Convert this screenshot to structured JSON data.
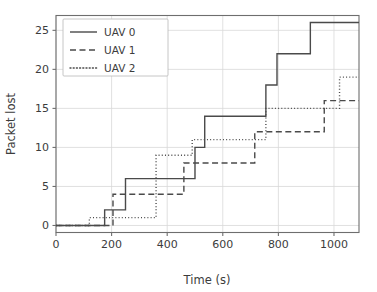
{
  "chart_data": {
    "type": "line",
    "subtype": "step-post",
    "title": "",
    "xlabel": "Time (s)",
    "ylabel": "Packet lost",
    "xlim": [
      0,
      1090
    ],
    "ylim": [
      -0.9,
      26.9
    ],
    "xticks": [
      0,
      200,
      400,
      600,
      800,
      1000
    ],
    "yticks": [
      0,
      5,
      10,
      15,
      20,
      25
    ],
    "xticklabels": [
      "0",
      "200",
      "400",
      "600",
      "800",
      "1000"
    ],
    "yticklabels": [
      "0",
      "5",
      "10",
      "15",
      "20",
      "25"
    ],
    "grid": true,
    "grid_color": "#d8d8d8",
    "legend_position": "upper-left",
    "line_color": "#4a4a4a",
    "series": [
      {
        "name": "UAV 0",
        "linestyle": "solid",
        "x": [
          0,
          175,
          175,
          250,
          250,
          500,
          500,
          535,
          535,
          750,
          750,
          760,
          760,
          795,
          795,
          915,
          915,
          1090
        ],
        "y": [
          0,
          0,
          2,
          2,
          6,
          6,
          10,
          10,
          14,
          14,
          14,
          18,
          18,
          22,
          22,
          26,
          26,
          26
        ],
        "steps": [
          {
            "x": 0,
            "y": 0
          },
          {
            "x": 175,
            "y": 2
          },
          {
            "x": 250,
            "y": 6
          },
          {
            "x": 500,
            "y": 10
          },
          {
            "x": 535,
            "y": 14
          },
          {
            "x": 755,
            "y": 18
          },
          {
            "x": 795,
            "y": 22
          },
          {
            "x": 915,
            "y": 26
          },
          {
            "x": 1090,
            "y": 26
          }
        ]
      },
      {
        "name": "UAV 1",
        "linestyle": "dashed",
        "x": [
          0,
          205,
          205,
          460,
          460,
          500,
          500,
          715,
          715,
          965,
          965,
          1090
        ],
        "y": [
          0,
          0,
          4,
          4,
          8,
          8,
          8,
          8,
          12,
          12,
          16,
          16
        ],
        "steps": [
          {
            "x": 0,
            "y": 0
          },
          {
            "x": 205,
            "y": 4
          },
          {
            "x": 460,
            "y": 8
          },
          {
            "x": 715,
            "y": 12
          },
          {
            "x": 965,
            "y": 16
          },
          {
            "x": 1090,
            "y": 16
          }
        ]
      },
      {
        "name": "UAV 2",
        "linestyle": "dotted",
        "x": [
          0,
          120,
          120,
          360,
          360,
          490,
          490,
          710,
          710,
          750,
          750,
          1020,
          1020,
          1090
        ],
        "y": [
          0,
          0,
          1,
          1,
          9,
          9,
          11,
          11,
          11,
          11,
          15,
          15,
          19,
          19
        ],
        "steps": [
          {
            "x": 0,
            "y": 0
          },
          {
            "x": 120,
            "y": 1
          },
          {
            "x": 360,
            "y": 9
          },
          {
            "x": 490,
            "y": 11
          },
          {
            "x": 755,
            "y": 15
          },
          {
            "x": 1020,
            "y": 19
          },
          {
            "x": 1090,
            "y": 19
          }
        ]
      }
    ]
  },
  "legend": {
    "entries": [
      {
        "label": "UAV 0",
        "linestyle": "solid"
      },
      {
        "label": "UAV 1",
        "linestyle": "dashed"
      },
      {
        "label": "UAV 2",
        "linestyle": "dotted"
      }
    ]
  },
  "axes": {
    "xlabel": "Time (s)",
    "ylabel": "Packet lost"
  }
}
